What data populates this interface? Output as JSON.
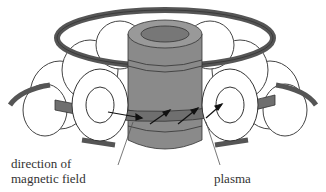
{
  "diagram": {
    "labels": {
      "field_line1": "direction of",
      "field_line2": "magnetic field",
      "plasma": "plasma"
    }
  }
}
